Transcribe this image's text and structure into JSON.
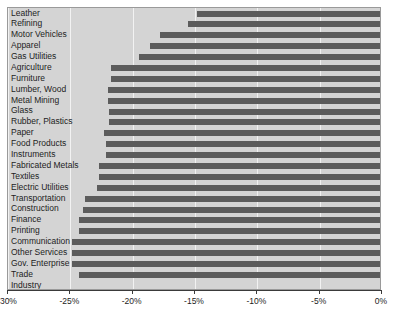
{
  "chart_data": {
    "type": "bar",
    "orientation": "horizontal",
    "title": "",
    "subtitle": "",
    "xlabel": "",
    "ylabel": "",
    "xlim": [
      -30,
      0
    ],
    "ylim": null,
    "grid": true,
    "legend": null,
    "xticks": [
      -30,
      -25,
      -20,
      -15,
      -10,
      -5,
      0
    ],
    "xtick_labels": [
      "-30%",
      "-25%",
      "-20%",
      "-15%",
      "-10%",
      "-5%",
      "0%"
    ],
    "categories": [
      "Leather",
      "Refining",
      "Motor Vehicles",
      "Apparel",
      "Gas Utilities",
      "Agriculture",
      "Furniture",
      "Lumber, Wood",
      "Metal Mining",
      "Glass",
      "Rubber, Plastics",
      "Paper",
      "Food Products",
      "Instruments",
      "Fabricated Metals",
      "Textiles",
      "Electric Utilities",
      "Transportation",
      "Construction",
      "Finance",
      "Printing",
      "Communication",
      "Other Services",
      "Gov. Enterprise",
      "Trade",
      "Industry"
    ],
    "values": [
      -14.8,
      -15.6,
      -17.8,
      -18.6,
      -19.5,
      -21.7,
      -21.7,
      -22.0,
      -22.0,
      -21.9,
      -21.9,
      -22.3,
      -22.1,
      -22.1,
      -22.7,
      -22.7,
      -22.9,
      -23.8,
      -24.0,
      -24.3,
      -24.3,
      -24.9,
      -24.9,
      -24.9,
      -24.3,
      null
    ],
    "colors": {
      "bar": "#5c5c5c",
      "panel": "#d4d4d4",
      "grid": "#f2f2f2",
      "axis": "#3a3a3a",
      "text": "#1d1d1d",
      "background": "#ffffff"
    }
  }
}
